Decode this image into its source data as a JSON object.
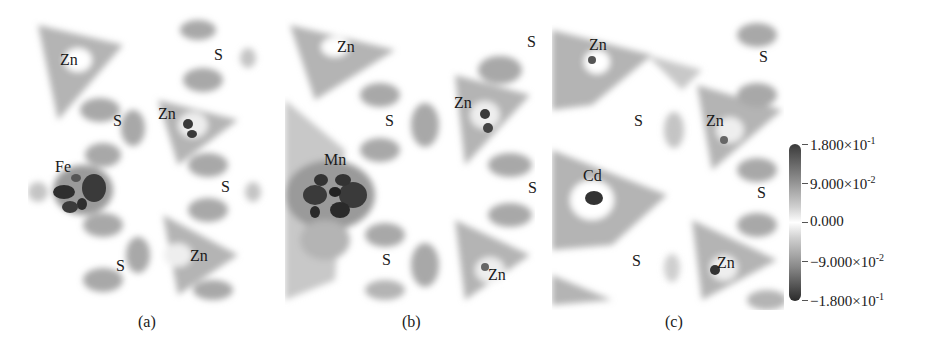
{
  "figure": {
    "panels": [
      {
        "id": "a",
        "caption": "(a)",
        "dopant": "Fe",
        "labels": [
          {
            "text": "Zn",
            "x": 60,
            "y": 60
          },
          {
            "text": "S",
            "x": 214,
            "y": 55
          },
          {
            "text": "S",
            "x": 113,
            "y": 121
          },
          {
            "text": "Zn",
            "x": 158,
            "y": 114
          },
          {
            "text": "Fe",
            "x": 55,
            "y": 167
          },
          {
            "text": "S",
            "x": 221,
            "y": 187
          },
          {
            "text": "S",
            "x": 116,
            "y": 266
          },
          {
            "text": "Zn",
            "x": 190,
            "y": 256
          }
        ]
      },
      {
        "id": "b",
        "caption": "(b)",
        "dopant": "Mn",
        "labels": [
          {
            "text": "Zn",
            "x": 337,
            "y": 47
          },
          {
            "text": "S",
            "x": 527,
            "y": 42
          },
          {
            "text": "S",
            "x": 385,
            "y": 121
          },
          {
            "text": "Zn",
            "x": 454,
            "y": 103
          },
          {
            "text": "Mn",
            "x": 324,
            "y": 160
          },
          {
            "text": "S",
            "x": 528,
            "y": 188
          },
          {
            "text": "S",
            "x": 382,
            "y": 260
          },
          {
            "text": "Zn",
            "x": 488,
            "y": 275
          }
        ]
      },
      {
        "id": "c",
        "caption": "(c)",
        "dopant": "Cd",
        "labels": [
          {
            "text": "Zn",
            "x": 589,
            "y": 45
          },
          {
            "text": "S",
            "x": 759,
            "y": 57
          },
          {
            "text": "S",
            "x": 634,
            "y": 121
          },
          {
            "text": "Zn",
            "x": 706,
            "y": 121
          },
          {
            "text": "Cd",
            "x": 583,
            "y": 176
          },
          {
            "text": "S",
            "x": 757,
            "y": 193
          },
          {
            "text": "S",
            "x": 632,
            "y": 261
          },
          {
            "text": "Zn",
            "x": 717,
            "y": 263
          }
        ]
      }
    ],
    "colorbar": {
      "max": "1.800",
      "ticks": [
        {
          "mant": "1.800",
          "exp": "-1",
          "top": 144
        },
        {
          "mant": "9.000",
          "exp": "-2",
          "top": 183
        },
        {
          "mant": "0.000",
          "exp": "",
          "top": 222
        },
        {
          "mant": "−9.000",
          "exp": "-2",
          "top": 261
        },
        {
          "mant": "−1.800",
          "exp": "-1",
          "top": 300
        }
      ],
      "times": "×10"
    }
  }
}
